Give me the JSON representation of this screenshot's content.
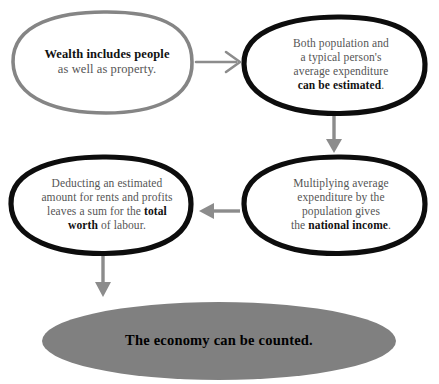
{
  "diagram": {
    "title": "The economy can be counted",
    "background_color": "#ffffff",
    "nodes": [
      {
        "id": "start",
        "position": "top-left",
        "shape": "ellipse",
        "stroke_color": "#808080",
        "fill_color": "#ffffff",
        "style": "hand-drawn",
        "line1_bold": "Wealth includes people",
        "line2_plain": "as well as property."
      },
      {
        "id": "estimated",
        "position": "top-right",
        "shape": "ellipse",
        "stroke_color": "#000000",
        "fill_color": "#ffffff",
        "style": "hand-drawn",
        "line1": "Both population and",
        "line2": "a typical person's",
        "line3": "average expenditure",
        "line4_bold": "can be estimated",
        "line4_tail": "."
      },
      {
        "id": "income",
        "position": "middle-right",
        "shape": "ellipse",
        "stroke_color": "#000000",
        "fill_color": "#ffffff",
        "style": "hand-drawn",
        "line1": "Multiplying average",
        "line2": "expenditure by the",
        "line3": "population gives",
        "line4_head": "the ",
        "line4_bold": "national income",
        "line4_tail": "."
      },
      {
        "id": "worth",
        "position": "middle-left",
        "shape": "ellipse",
        "stroke_color": "#000000",
        "fill_color": "#ffffff",
        "style": "hand-drawn",
        "line1": "Deducting an estimated",
        "line2": "amount for rents and profits",
        "line3_head": "leaves a sum for the ",
        "line3_bold": "total",
        "line4_bold": "worth",
        "line4_tail": " of labour."
      },
      {
        "id": "conclusion",
        "position": "bottom",
        "shape": "ellipse",
        "stroke_color": "none",
        "fill_color": "#808080",
        "style": "filled",
        "text": "The economy can be counted."
      }
    ],
    "arrows": [
      {
        "id": "arrow-start-to-estimated",
        "direction": "right",
        "from": "start",
        "to": "estimated",
        "color": "#8c8c8c",
        "head_style": "open-v"
      },
      {
        "id": "arrow-estimated-to-income",
        "direction": "down",
        "from": "estimated",
        "to": "income",
        "color": "#8c8c8c",
        "head_style": "solid-triangle"
      },
      {
        "id": "arrow-income-to-worth",
        "direction": "left",
        "from": "income",
        "to": "worth",
        "color": "#8c8c8c",
        "head_style": "solid-triangle"
      },
      {
        "id": "arrow-worth-to-conclusion",
        "direction": "down",
        "from": "worth",
        "to": "conclusion",
        "color": "#8c8c8c",
        "head_style": "solid-triangle"
      }
    ]
  }
}
